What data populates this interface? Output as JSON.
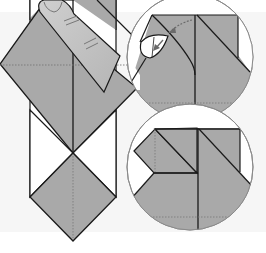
{
  "diagram": {
    "type": "origami-instruction",
    "colors": {
      "paper": "#a9a9a9",
      "paper_light": "#b7b7b7",
      "background": "#ffffff",
      "background_band": "#f4f4f4",
      "line": "#1a1a1a",
      "circle_outline": "#8a8a8a",
      "finger": "#c4c4c4",
      "finger_shadow": "#9a9a9a",
      "dotted": "#777777",
      "arrow": "#6a6a6a"
    },
    "main_model": {
      "label": "main-model",
      "elements": [
        "vertical-strip",
        "large-diamond",
        "lower-diamond",
        "white-triangles",
        "center-crease",
        "horizontal-dotted-crease",
        "finger"
      ]
    },
    "insets": [
      {
        "label": "detail-inset-top",
        "content": "squash-fold in progress with curved flap and two arrows"
      },
      {
        "label": "detail-inset-bottom",
        "content": "result after squash-fold, small square flap on left"
      }
    ]
  }
}
